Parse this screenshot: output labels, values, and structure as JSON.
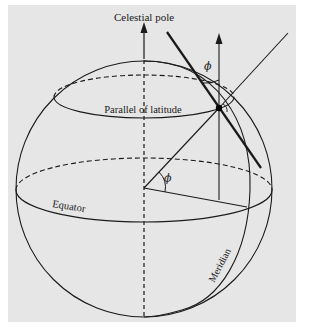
{
  "figure": {
    "background_color": "#e6e6e6",
    "line_color": "#1a1a1a",
    "labels": {
      "celestial_pole": "Celestial pole",
      "parallel_of_latitude": "Parallel of latitude",
      "equator": "Equator",
      "meridian": "Meridian",
      "latitude_angle_center": "ϕ",
      "latitude_angle_top": "ϕ"
    }
  }
}
